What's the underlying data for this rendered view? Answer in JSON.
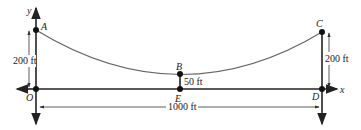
{
  "diagram": {
    "type": "cable-parabola",
    "axes": {
      "x_label": "x",
      "y_label": "y"
    },
    "points": [
      {
        "id": "A",
        "label": "A",
        "x": 36,
        "y": 30
      },
      {
        "id": "B",
        "label": "B",
        "x": 180,
        "y": 74
      },
      {
        "id": "C",
        "label": "C",
        "x": 322,
        "y": 32
      },
      {
        "id": "D",
        "label": "D",
        "x": 322,
        "y": 89
      },
      {
        "id": "E",
        "label": "E",
        "x": 180,
        "y": 89
      },
      {
        "id": "O",
        "label": "O",
        "x": 36,
        "y": 89
      }
    ],
    "dimensions": {
      "left_height": "200 ft",
      "right_height": "200 ft",
      "sag_height": "50 ft",
      "span": "1000 ft"
    },
    "colors": {
      "line": "#222222",
      "curve": "#666666",
      "dim": "#333333"
    }
  }
}
